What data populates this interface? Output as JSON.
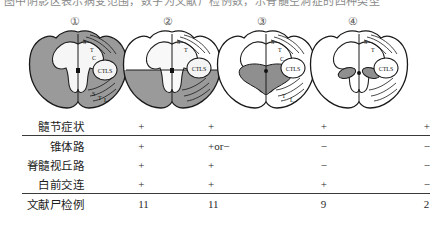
{
  "header": {
    "clipped_line": "图中阴影区表示病变范围，数字为文献尸检例数，示脊髓空洞症的四种类型"
  },
  "figure": {
    "numbers": [
      "①",
      "②",
      "③",
      "④"
    ],
    "number_positions_x": [
      75,
      168,
      262,
      353
    ],
    "diagram_positions_x": [
      26,
      120,
      214,
      307
    ],
    "diagrams": [
      {
        "id": "diagram-1",
        "label": "①",
        "tract_labels": [
          "S",
          "T",
          "C",
          "CTLS",
          "S",
          "T",
          "L",
          "S"
        ],
        "shading": "full-gray-butterfly-white",
        "description": "全髓横断面广泛阴影"
      },
      {
        "id": "diagram-2",
        "label": "②",
        "tract_labels": [
          "S",
          "T",
          "C",
          "CTLS",
          "S",
          "T",
          "L",
          "S"
        ],
        "shading": "lower-half-gray",
        "description": "下半侧阴影"
      },
      {
        "id": "diagram-3",
        "label": "③",
        "tract_labels": [
          "S",
          "T",
          "C",
          "CTLS",
          "S",
          "T",
          "L",
          "S"
        ],
        "shading": "central-butterfly-gray",
        "description": "中央灰质蝶形阴影"
      },
      {
        "id": "diagram-4",
        "label": "④",
        "tract_labels": [
          "S",
          "T",
          "C",
          "CTLS",
          "S",
          "T",
          "L",
          "S"
        ],
        "shading": "two-small-ovals-gray",
        "description": "两侧小卵圆形阴影"
      }
    ]
  },
  "table": {
    "rows": [
      {
        "label": "髓节症状",
        "values": [
          "+",
          "+",
          "+",
          "+"
        ]
      },
      {
        "label": "锥体路",
        "values": [
          "+",
          "+or−",
          "−",
          "−"
        ]
      },
      {
        "label": "脊髓视丘路",
        "values": [
          "+",
          "+",
          "−",
          "−"
        ]
      },
      {
        "label": "白前交连",
        "values": [
          "+",
          "+",
          "+",
          "−"
        ]
      },
      {
        "label": "文献尸检例",
        "values": [
          "11",
          "11",
          "9",
          "2"
        ]
      }
    ]
  },
  "colors": {
    "ink": "#1c1c1c",
    "rule": "#3a3a3a",
    "shade_dark": "#8f8f8f",
    "shade_mid": "#a8a8a8",
    "outline": "#222222",
    "paper": "#ffffff"
  }
}
